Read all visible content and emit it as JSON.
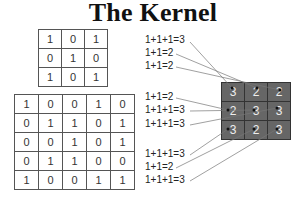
{
  "title": "The Kernel",
  "kernel": [
    [
      1,
      0,
      1
    ],
    [
      0,
      1,
      0
    ],
    [
      1,
      0,
      1
    ]
  ],
  "image": [
    [
      1,
      0,
      0,
      1,
      0
    ],
    [
      0,
      1,
      1,
      0,
      1
    ],
    [
      0,
      0,
      1,
      0,
      1
    ],
    [
      0,
      1,
      1,
      0,
      0
    ],
    [
      1,
      0,
      0,
      1,
      1
    ]
  ],
  "output": [
    [
      3,
      2,
      2
    ],
    [
      2,
      3,
      3
    ],
    [
      3,
      2,
      3
    ]
  ],
  "calculations": [
    {
      "text": "1+1+1=3",
      "top": 34
    },
    {
      "text": "1+1=2",
      "top": 47
    },
    {
      "text": "1+1=2",
      "top": 60
    },
    {
      "text": "1+1=2",
      "top": 91
    },
    {
      "text": "1+1+1=3",
      "top": 104
    },
    {
      "text": "1+1+1=3",
      "top": 118
    },
    {
      "text": "1+1+1=3",
      "top": 148
    },
    {
      "text": "1+1=2",
      "top": 161
    },
    {
      "text": "1+1+1=3",
      "top": 174
    }
  ]
}
